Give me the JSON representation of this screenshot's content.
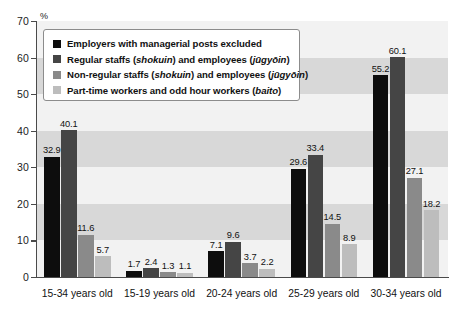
{
  "chart_data": {
    "type": "bar",
    "title": "",
    "xlabel": "",
    "ylabel": "%",
    "ylim": [
      0,
      70
    ],
    "yticks": [
      0,
      10,
      20,
      30,
      40,
      50,
      60,
      70
    ],
    "grid": "horizontal alternating bands every 10 units",
    "legend_position": "top-left inside plot area",
    "categories": [
      "15-34 years old",
      "15-19 years old",
      "20-24 years old",
      "25-29 years old",
      "30-34 years old"
    ],
    "series": [
      {
        "name": "Employers with managerial posts excluded",
        "color": "#0d0d0d",
        "values": [
          32.9,
          1.7,
          7.1,
          29.6,
          55.2
        ]
      },
      {
        "name": "Regular staffs (shokuin) and employees (jūgyōin)",
        "color": "#454545",
        "values": [
          40.1,
          2.4,
          9.6,
          33.4,
          60.1
        ]
      },
      {
        "name": "Non-regular staffs (shokuin) and employees (jūgyōin)",
        "color": "#8a8a8a",
        "values": [
          11.6,
          1.3,
          3.7,
          14.5,
          27.1
        ]
      },
      {
        "name": "Part-time workers and odd hour workers (baito)",
        "color": "#bdbdbd",
        "values": [
          5.7,
          1.1,
          2.2,
          8.9,
          18.2
        ]
      }
    ]
  },
  "legend": {
    "items": [
      {
        "swatch_color": "#0d0d0d",
        "parts": [
          {
            "text": "Employers with managerial posts excluded",
            "italic": false
          }
        ]
      },
      {
        "swatch_color": "#454545",
        "parts": [
          {
            "text": "Regular staffs (",
            "italic": false
          },
          {
            "text": "shokuin",
            "italic": true
          },
          {
            "text": ") and employees (",
            "italic": false
          },
          {
            "text": "jūgyōin",
            "italic": true
          },
          {
            "text": ")",
            "italic": false
          }
        ]
      },
      {
        "swatch_color": "#8a8a8a",
        "parts": [
          {
            "text": "Non-regular staffs (",
            "italic": false
          },
          {
            "text": "shokuin",
            "italic": true
          },
          {
            "text": ") and employees (",
            "italic": false
          },
          {
            "text": "jūgyōin",
            "italic": true
          },
          {
            "text": ")",
            "italic": false
          }
        ]
      },
      {
        "swatch_color": "#bdbdbd",
        "parts": [
          {
            "text": "Part-time workers and odd hour workers (",
            "italic": false
          },
          {
            "text": "baito",
            "italic": true
          },
          {
            "text": ")",
            "italic": false
          }
        ]
      }
    ]
  },
  "axis": {
    "y_unit_label": "%",
    "y_tick_labels": [
      "70",
      "60",
      "50",
      "40",
      "30",
      "20",
      "10",
      "0"
    ]
  },
  "style": {
    "plot_background": "#f2f2f2",
    "band_light": "#f2f2f2",
    "band_dark": "#d8d8d8",
    "axis_color": "#4a4a4a",
    "text_color": "#111111"
  }
}
